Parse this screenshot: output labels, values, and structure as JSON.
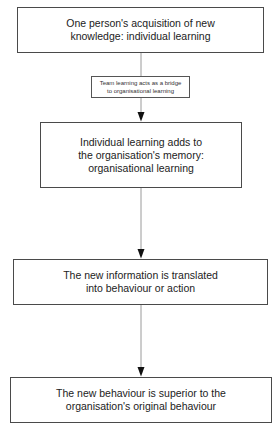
{
  "diagram": {
    "type": "flowchart",
    "direction": "top-to-bottom",
    "nodes": [
      {
        "id": "n1",
        "text": "One person's acquisition of new\nknowledge: individual learning"
      },
      {
        "id": "n2",
        "text": "Individual learning adds to\nthe organisation's memory:\norganisational learning"
      },
      {
        "id": "n3",
        "text": "The new information is translated\ninto behaviour or action"
      },
      {
        "id": "n4",
        "text": "The new behaviour is superior to the\norganisation's original behaviour"
      }
    ],
    "edges": [
      {
        "from": "n1",
        "to": "n2",
        "label": "Team learning acts as a bridge\nto organisational learning"
      },
      {
        "from": "n2",
        "to": "n3",
        "label": ""
      },
      {
        "from": "n3",
        "to": "n4",
        "label": ""
      }
    ],
    "colors": {
      "border": "#4a4a4a",
      "text": "#222222",
      "line": "#9a9a9a",
      "arrowhead": "#111111",
      "background": "#ffffff"
    }
  }
}
